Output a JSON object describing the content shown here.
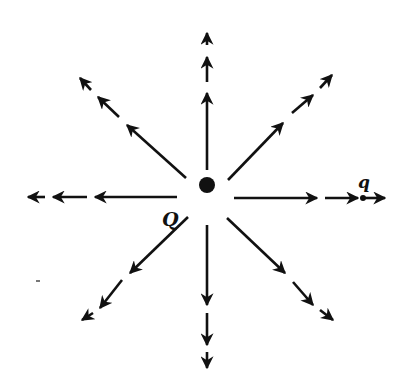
{
  "diagram": {
    "source_charge": {
      "label": "Q",
      "x": 207,
      "y": 185,
      "radius": 8
    },
    "test_charge": {
      "label": "q",
      "x": 363,
      "y": 198,
      "radius": 3
    },
    "colors": {
      "ink": "#111111",
      "background": "#ffffff"
    },
    "field_lines": [
      {
        "name": "up",
        "segments": [
          [
            207,
            170,
            207,
            93
          ],
          [
            207,
            82,
            207,
            57
          ],
          [
            207,
            45,
            207,
            33
          ]
        ]
      },
      {
        "name": "up-right",
        "segments": [
          [
            228,
            180,
            283,
            123
          ],
          [
            292,
            113,
            313,
            95
          ],
          [
            320,
            88,
            332,
            75
          ]
        ]
      },
      {
        "name": "right",
        "segments": [
          [
            234,
            198,
            317,
            198
          ],
          [
            325,
            198,
            358,
            198
          ],
          [
            363,
            198,
            385,
            198
          ]
        ]
      },
      {
        "name": "down-right",
        "segments": [
          [
            227,
            218,
            285,
            273
          ],
          [
            293,
            282,
            313,
            305
          ],
          [
            320,
            310,
            333,
            320
          ]
        ]
      },
      {
        "name": "down",
        "segments": [
          [
            207,
            225,
            207,
            305
          ],
          [
            207,
            313,
            207,
            345
          ],
          [
            207,
            352,
            207,
            368
          ]
        ]
      },
      {
        "name": "down-left",
        "segments": [
          [
            188,
            217,
            130,
            273
          ],
          [
            122,
            280,
            100,
            308
          ],
          [
            93,
            313,
            82,
            320
          ]
        ]
      },
      {
        "name": "left",
        "segments": [
          [
            177,
            197,
            95,
            197
          ],
          [
            87,
            197,
            53,
            197
          ],
          [
            45,
            197,
            28,
            197
          ]
        ]
      },
      {
        "name": "up-left",
        "segments": [
          [
            186,
            178,
            127,
            125
          ],
          [
            119,
            117,
            98,
            97
          ],
          [
            91,
            90,
            80,
            78
          ]
        ]
      }
    ]
  }
}
